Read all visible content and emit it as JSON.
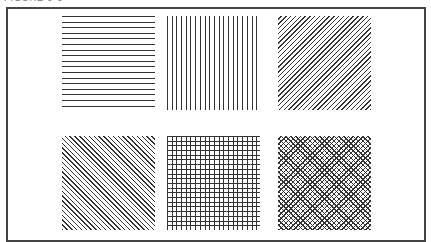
{
  "figure": {
    "caption": "FIGURE 9-9",
    "patterns": [
      {
        "id": "horizontal-lines",
        "label": "Horizontal line fill"
      },
      {
        "id": "vertical-lines",
        "label": "Vertical line fill"
      },
      {
        "id": "diagonal-lines-right",
        "label": "Diagonal line fill (rising)"
      },
      {
        "id": "diagonal-lines-left",
        "label": "Diagonal line fill (falling)"
      },
      {
        "id": "square-grid",
        "label": "Square grid fill"
      },
      {
        "id": "diagonal-crosshatch",
        "label": "Diagonal crosshatch fill"
      }
    ]
  }
}
